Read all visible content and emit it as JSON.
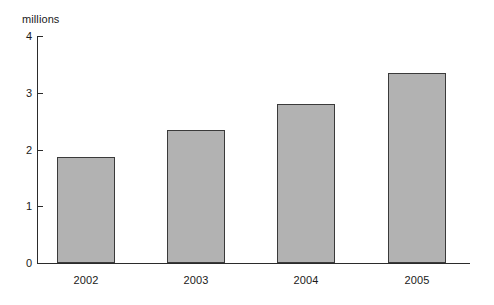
{
  "chart_data": {
    "type": "bar",
    "title": "",
    "subtitle": "",
    "categories": [
      "2002",
      "2003",
      "2004",
      "2005"
    ],
    "values": [
      1.87,
      2.35,
      2.81,
      3.35
    ],
    "xlabel": "",
    "ylabel": "millions",
    "ylim": [
      0,
      4
    ],
    "yticks": [
      "0",
      "1",
      "2",
      "3",
      "4"
    ],
    "ytick_values": [
      0,
      1,
      2,
      3,
      4
    ],
    "grid": false,
    "legend": null,
    "bar_fill_color": "#b2b2b2",
    "bar_border_color": "#3a3a3a",
    "axis_color": "#2b2b2b",
    "text_color": "#1a1a1a",
    "background_color": "#ffffff"
  },
  "labels": {
    "unit": "millions",
    "y0": "0",
    "y1": "1",
    "y2": "2",
    "y3": "3",
    "y4": "4",
    "x0": "2002",
    "x1": "2003",
    "x2": "2004",
    "x3": "2005"
  }
}
